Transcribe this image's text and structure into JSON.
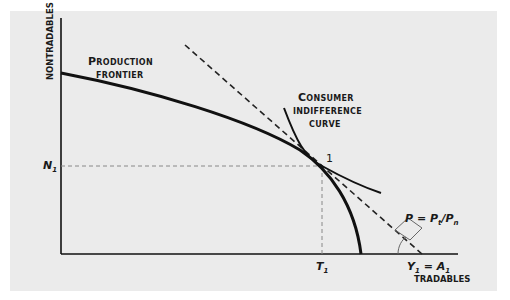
{
  "diagram": {
    "title": "",
    "axes": {
      "y_label": "NONTRADABLES",
      "x_label": "TRADABLES"
    },
    "curves": {
      "production_frontier": {
        "line1": "Production",
        "line2": "frontier"
      },
      "indifference_curve": {
        "line1": "Consumer",
        "line2": "indifference",
        "line3": "curve"
      },
      "budget_line": {
        "label": "P = Pt/Pn",
        "P": "P",
        "eq": "=",
        "Pt": "P",
        "t": "t",
        "slash": "/",
        "Pn": "P",
        "n": "n"
      }
    },
    "points": {
      "tangency": "1",
      "N1": {
        "main": "N",
        "sub": "1"
      },
      "T1": {
        "main": "T",
        "sub": "1"
      },
      "Y1": {
        "main": "Y",
        "sub": "1",
        "eq": "=",
        "A": "A",
        "asub": "1"
      }
    },
    "colors": {
      "background": "#ffffff",
      "panel": "#ebebeb",
      "line": "#111111",
      "guide": "#777777"
    }
  }
}
